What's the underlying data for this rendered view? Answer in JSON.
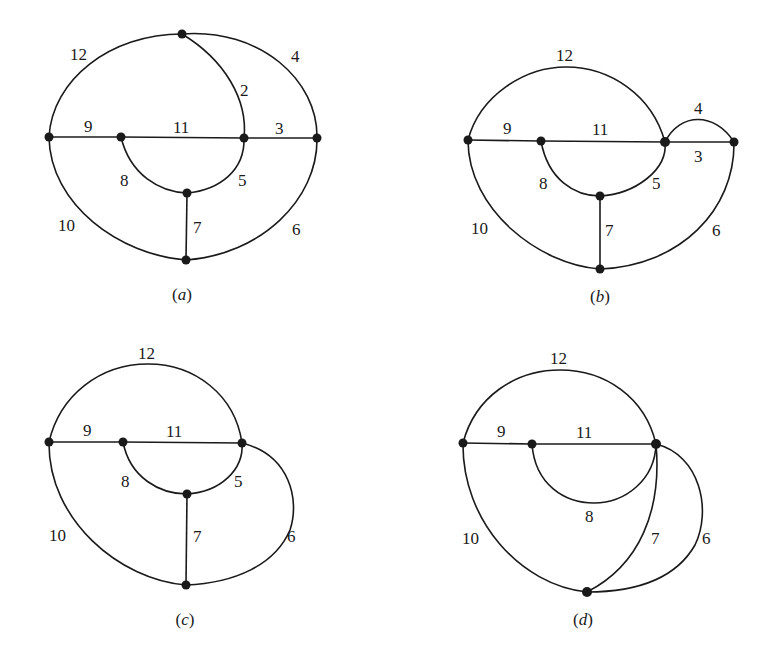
{
  "figure": {
    "panels": [
      {
        "id": "a",
        "caption": "(a)",
        "caption_letter": "a",
        "edge_labels": {
          "e12": "12",
          "e4": "4",
          "e2": "2",
          "e9": "9",
          "e11": "11",
          "e3": "3",
          "e8": "8",
          "e5": "5",
          "e10": "10",
          "e7": "7",
          "e6": "6"
        }
      },
      {
        "id": "b",
        "caption": "(b)",
        "caption_letter": "b",
        "edge_labels": {
          "e12": "12",
          "e4": "4",
          "e9": "9",
          "e11": "11",
          "e3": "3",
          "e8": "8",
          "e5": "5",
          "e10": "10",
          "e7": "7",
          "e6": "6"
        }
      },
      {
        "id": "c",
        "caption": "(c)",
        "caption_letter": "c",
        "edge_labels": {
          "e12": "12",
          "e9": "9",
          "e11": "11",
          "e8": "8",
          "e5": "5",
          "e10": "10",
          "e7": "7",
          "e6": "6"
        }
      },
      {
        "id": "d",
        "caption": "(d)",
        "caption_letter": "d",
        "edge_labels": {
          "e12": "12",
          "e9": "9",
          "e11": "11",
          "e8": "8",
          "e10": "10",
          "e7": "7",
          "e6": "6"
        }
      }
    ],
    "colors": {
      "ink": "#1a1a1a",
      "background": "#ffffff"
    }
  }
}
